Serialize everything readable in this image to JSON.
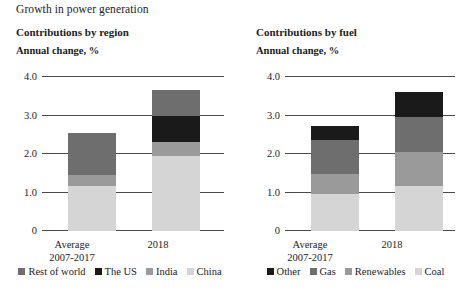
{
  "title": "Growth in power generation",
  "axis": {
    "ticks": [
      "4.0",
      "3.0",
      "2.0",
      "1.0",
      "0"
    ],
    "tick_values": [
      4.0,
      3.0,
      2.0,
      1.0,
      0
    ],
    "ylim": [
      0,
      4.0
    ]
  },
  "categories": [
    "Average\n2007-2017",
    "2018"
  ],
  "category_labels": [
    {
      "line1": "Average",
      "line2": "2007-2017"
    },
    {
      "line1": "2018",
      "line2": ""
    }
  ],
  "colors": {
    "black": "#1a1a1a",
    "dark_grey": "#6e6e6e",
    "medium_grey": "#9a9a9a",
    "light_grey": "#d5d5d5",
    "axis": "#4a4a4a"
  },
  "panels": [
    {
      "id": "by-region",
      "heading": "Contributions by region",
      "subheading": "Annual change, %",
      "legend": [
        {
          "label": "Rest of world",
          "color": "#6e6e6e"
        },
        {
          "label": "The US",
          "color": "#1a1a1a"
        },
        {
          "label": "India",
          "color": "#9a9a9a"
        },
        {
          "label": "China",
          "color": "#d5d5d5"
        }
      ]
    },
    {
      "id": "by-fuel",
      "heading": "Contributions by fuel",
      "subheading": "Annual change, %",
      "legend": [
        {
          "label": "Other",
          "color": "#1a1a1a"
        },
        {
          "label": "Gas",
          "color": "#6e6e6e"
        },
        {
          "label": "Renewables",
          "color": "#9a9a9a"
        },
        {
          "label": "Coal",
          "color": "#d5d5d5"
        }
      ]
    }
  ],
  "chart_data": [
    {
      "type": "bar",
      "stacked": true,
      "title": "Contributions by region",
      "subtitle": "Annual change, %",
      "xlabel": "",
      "ylabel": "Annual change, %",
      "ylim": [
        0,
        4.0
      ],
      "yticks": [
        0,
        1.0,
        2.0,
        3.0,
        4.0
      ],
      "grid": true,
      "legend_position": "bottom",
      "categories": [
        "Average 2007-2017",
        "2018"
      ],
      "series": [
        {
          "name": "China",
          "color": "#d5d5d5",
          "values": [
            1.17,
            1.95
          ]
        },
        {
          "name": "India",
          "color": "#9a9a9a",
          "values": [
            0.28,
            0.35
          ]
        },
        {
          "name": "The US",
          "color": "#1a1a1a",
          "values": [
            0.0,
            0.7
          ]
        },
        {
          "name": "Rest of world",
          "color": "#6e6e6e",
          "values": [
            1.1,
            0.65
          ]
        }
      ],
      "totals": [
        2.55,
        3.65
      ]
    },
    {
      "type": "bar",
      "stacked": true,
      "title": "Contributions by fuel",
      "subtitle": "Annual change, %",
      "xlabel": "",
      "ylabel": "Annual change, %",
      "ylim": [
        0,
        4.0
      ],
      "yticks": [
        0,
        1.0,
        2.0,
        3.0,
        4.0
      ],
      "grid": true,
      "legend_position": "bottom",
      "categories": [
        "Average 2007-2017",
        "2018"
      ],
      "series": [
        {
          "name": "Coal",
          "color": "#d5d5d5",
          "values": [
            0.96,
            1.17
          ]
        },
        {
          "name": "Renewables",
          "color": "#9a9a9a",
          "values": [
            0.52,
            0.88
          ]
        },
        {
          "name": "Gas",
          "color": "#6e6e6e",
          "values": [
            0.88,
            0.91
          ]
        },
        {
          "name": "Other",
          "color": "#1a1a1a",
          "values": [
            0.37,
            0.66
          ]
        }
      ],
      "totals": [
        2.73,
        3.62
      ]
    }
  ]
}
